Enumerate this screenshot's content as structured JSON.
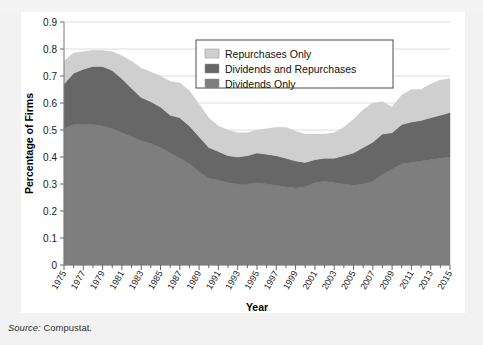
{
  "page": {
    "top_cut_text": "",
    "source_prefix": "Source:",
    "source_value": "Compustat."
  },
  "legend": {
    "position": "top-center-right",
    "items": [
      {
        "label": "Repurchases Only",
        "color": "#cfcfcf"
      },
      {
        "label": "Dividends and Repurchases",
        "color": "#676767"
      },
      {
        "label": "Dividends Only",
        "color": "#7e7e7e"
      }
    ]
  },
  "chart_data": {
    "type": "area",
    "stacked": true,
    "title": "",
    "subtitle": "",
    "xlabel": "Year",
    "ylabel": "Percentage of Firms",
    "ylim": [
      0,
      0.9
    ],
    "xlim": [
      1975,
      2015
    ],
    "grid": true,
    "grid_axis": "y",
    "y_ticks": [
      "0",
      "0.1",
      "0.2",
      "0.3",
      "0.4",
      "0.5",
      "0.6",
      "0.7",
      "0.8",
      "0.9"
    ],
    "y_tick_values": [
      0,
      0.1,
      0.2,
      0.3,
      0.4,
      0.5,
      0.6,
      0.7,
      0.8,
      0.9
    ],
    "x_tick_labels": [
      "1975",
      "1977",
      "1979",
      "1981",
      "1983",
      "1985",
      "1987",
      "1989",
      "1991",
      "1993",
      "1995",
      "1997",
      "1999",
      "2001",
      "2003",
      "2005",
      "2007",
      "2009",
      "2011",
      "2013",
      "2015"
    ],
    "x": [
      1975,
      1976,
      1977,
      1978,
      1979,
      1980,
      1981,
      1982,
      1983,
      1984,
      1985,
      1986,
      1987,
      1988,
      1989,
      1990,
      1991,
      1992,
      1993,
      1994,
      1995,
      1996,
      1997,
      1998,
      1999,
      2000,
      2001,
      2002,
      2003,
      2004,
      2005,
      2006,
      2007,
      2008,
      2009,
      2010,
      2011,
      2012,
      2013,
      2014,
      2015
    ],
    "legend_position": "upper-center",
    "series": [
      {
        "name": "Dividends Only",
        "color": "#7e7e7e",
        "values": [
          0.505,
          0.52,
          0.52,
          0.52,
          0.515,
          0.505,
          0.49,
          0.475,
          0.46,
          0.45,
          0.435,
          0.415,
          0.395,
          0.375,
          0.345,
          0.32,
          0.315,
          0.305,
          0.3,
          0.3,
          0.305,
          0.3,
          0.295,
          0.29,
          0.285,
          0.29,
          0.305,
          0.31,
          0.305,
          0.3,
          0.295,
          0.3,
          0.31,
          0.335,
          0.355,
          0.375,
          0.38,
          0.385,
          0.39,
          0.395,
          0.4
        ]
      },
      {
        "name": "Dividends and Repurchases",
        "color": "#676767",
        "values": [
          0.165,
          0.19,
          0.205,
          0.215,
          0.22,
          0.215,
          0.2,
          0.18,
          0.16,
          0.155,
          0.15,
          0.14,
          0.15,
          0.14,
          0.13,
          0.115,
          0.105,
          0.1,
          0.1,
          0.105,
          0.11,
          0.11,
          0.11,
          0.105,
          0.1,
          0.09,
          0.085,
          0.085,
          0.09,
          0.105,
          0.12,
          0.135,
          0.145,
          0.15,
          0.135,
          0.145,
          0.15,
          0.15,
          0.155,
          0.16,
          0.165
        ]
      },
      {
        "name": "Repurchases Only",
        "color": "#cfcfcf",
        "values": [
          0.085,
          0.075,
          0.065,
          0.06,
          0.06,
          0.07,
          0.085,
          0.1,
          0.11,
          0.11,
          0.115,
          0.125,
          0.13,
          0.13,
          0.12,
          0.11,
          0.095,
          0.095,
          0.09,
          0.085,
          0.085,
          0.095,
          0.105,
          0.115,
          0.11,
          0.105,
          0.095,
          0.09,
          0.095,
          0.105,
          0.125,
          0.14,
          0.145,
          0.12,
          0.095,
          0.11,
          0.12,
          0.115,
          0.125,
          0.13,
          0.125
        ]
      }
    ]
  }
}
